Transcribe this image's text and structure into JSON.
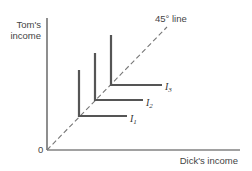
{
  "diagram": {
    "y_axis_label_line1": "Tom's",
    "y_axis_label_line2": "income",
    "x_axis_label": "Dick's income",
    "origin_label": "0",
    "diagonal_label": "45° line",
    "curves": [
      {
        "name": "I",
        "sub": "1"
      },
      {
        "name": "I",
        "sub": "2"
      },
      {
        "name": "I",
        "sub": "3"
      }
    ],
    "colors": {
      "axis": "#444444",
      "curve": "#555555",
      "dash": "#777777"
    }
  }
}
